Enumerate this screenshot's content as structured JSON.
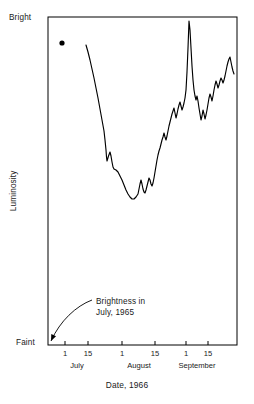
{
  "chart_data": {
    "type": "line",
    "title": "",
    "xlabel": "Date, 1966",
    "ylabel": "Luminosity",
    "ylim_labels": {
      "top": "Bright",
      "bottom": "Faint"
    },
    "grid": false,
    "legend": null,
    "x_ticks": [
      {
        "label": "1",
        "month": "July",
        "x_px": 65
      },
      {
        "label": "15",
        "month": "July",
        "x_px": 88
      },
      {
        "label": "1",
        "month": "August",
        "x_px": 122
      },
      {
        "label": "15",
        "month": "August",
        "x_px": 155
      },
      {
        "label": "1",
        "month": "September",
        "x_px": 186
      },
      {
        "label": "15",
        "month": "September",
        "x_px": 208
      }
    ],
    "month_labels": [
      {
        "name": "July",
        "center_px": 77
      },
      {
        "name": "August",
        "center_px": 139
      },
      {
        "name": "September",
        "center_px": 197
      }
    ],
    "annotations": [
      {
        "name": "previous-year-brightness",
        "line1": "Brightness in",
        "line2": "July, 1965",
        "marker_point": {
          "x_px": 62,
          "y_px": 43
        },
        "arrow_from": {
          "x_px": 92,
          "y_px": 300
        },
        "arrow_to": {
          "x_px": 50,
          "y_px": 343
        }
      }
    ],
    "series": [
      {
        "name": "luminosity-light-curve",
        "points_px": [
          [
            86,
            45
          ],
          [
            88,
            52
          ],
          [
            90,
            60
          ],
          [
            92,
            69
          ],
          [
            94,
            78
          ],
          [
            96,
            88
          ],
          [
            98,
            98
          ],
          [
            100,
            109
          ],
          [
            102,
            120
          ],
          [
            104,
            131
          ],
          [
            105,
            140
          ],
          [
            106,
            150
          ],
          [
            106.5,
            157
          ],
          [
            107,
            161
          ],
          [
            108.5,
            156
          ],
          [
            110,
            152
          ],
          [
            111,
            156
          ],
          [
            112,
            162
          ],
          [
            113,
            167
          ],
          [
            114,
            169
          ],
          [
            116,
            170
          ],
          [
            118,
            172
          ],
          [
            120,
            176
          ],
          [
            122,
            180
          ],
          [
            124,
            185
          ],
          [
            126,
            190
          ],
          [
            128,
            194
          ],
          [
            130,
            197
          ],
          [
            132,
            199
          ],
          [
            134,
            199
          ],
          [
            136,
            197
          ],
          [
            138,
            194
          ],
          [
            139,
            189
          ],
          [
            140,
            184
          ],
          [
            141,
            180
          ],
          [
            142,
            184
          ],
          [
            143,
            189
          ],
          [
            144,
            192
          ],
          [
            145,
            193
          ],
          [
            146,
            190
          ],
          [
            147,
            186
          ],
          [
            148,
            182
          ],
          [
            149,
            178
          ],
          [
            150,
            180
          ],
          [
            151,
            184
          ],
          [
            152,
            186
          ],
          [
            153,
            183
          ],
          [
            154,
            178
          ],
          [
            155,
            172
          ],
          [
            156,
            166
          ],
          [
            157,
            160
          ],
          [
            158,
            155
          ],
          [
            159,
            151
          ],
          [
            160,
            148
          ],
          [
            161,
            144
          ],
          [
            162,
            140
          ],
          [
            163,
            137
          ],
          [
            164,
            133
          ],
          [
            165,
            137
          ],
          [
            166,
            140
          ],
          [
            167,
            136
          ],
          [
            168,
            131
          ],
          [
            169,
            126
          ],
          [
            170,
            122
          ],
          [
            171,
            118
          ],
          [
            172,
            114
          ],
          [
            173,
            111
          ],
          [
            174,
            108
          ],
          [
            175,
            113
          ],
          [
            176,
            118
          ],
          [
            177,
            114
          ],
          [
            178,
            109
          ],
          [
            179,
            105
          ],
          [
            180,
            102
          ],
          [
            181,
            106
          ],
          [
            182,
            110
          ],
          [
            183,
            107
          ],
          [
            184,
            103
          ],
          [
            185,
            98
          ],
          [
            186,
            90
          ],
          [
            187,
            72
          ],
          [
            188,
            48
          ],
          [
            189,
            21
          ],
          [
            190,
            30
          ],
          [
            191,
            48
          ],
          [
            192,
            66
          ],
          [
            193,
            80
          ],
          [
            194,
            90
          ],
          [
            195,
            96
          ],
          [
            196,
            100
          ],
          [
            197,
            96
          ],
          [
            198,
            101
          ],
          [
            199,
            108
          ],
          [
            200,
            114
          ],
          [
            201,
            120
          ],
          [
            202,
            116
          ],
          [
            203,
            110
          ],
          [
            204,
            114
          ],
          [
            205,
            119
          ],
          [
            206,
            115
          ],
          [
            207,
            110
          ],
          [
            208,
            104
          ],
          [
            209,
            98
          ],
          [
            210,
            94
          ],
          [
            211,
            97
          ],
          [
            212,
            101
          ],
          [
            213,
            96
          ],
          [
            214,
            90
          ],
          [
            215,
            85
          ],
          [
            216,
            81
          ],
          [
            217,
            84
          ],
          [
            218,
            88
          ],
          [
            219,
            85
          ],
          [
            220,
            81
          ],
          [
            221,
            78
          ],
          [
            222,
            80
          ],
          [
            223,
            83
          ],
          [
            224,
            80
          ],
          [
            225,
            76
          ],
          [
            226,
            71
          ],
          [
            227,
            66
          ],
          [
            228,
            62
          ],
          [
            229,
            59
          ],
          [
            230,
            57
          ],
          [
            231,
            62
          ],
          [
            232,
            67
          ],
          [
            233,
            71
          ],
          [
            234,
            74
          ]
        ]
      }
    ]
  },
  "frame": {
    "left_px": 48,
    "right_px": 237,
    "top_px": 17,
    "bottom_px": 345
  }
}
